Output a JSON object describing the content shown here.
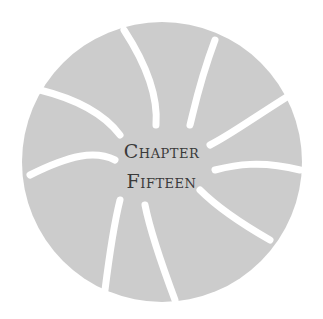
{
  "chapter_heading": {
    "line1": "Chapter",
    "line2": "Fifteen"
  },
  "colors": {
    "background": "#ffffff",
    "disc": "#cccccc",
    "text": "#3a3a3a"
  }
}
